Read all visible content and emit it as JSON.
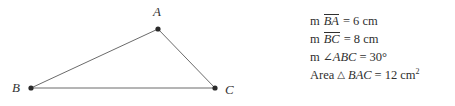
{
  "figure": {
    "type": "triangle-diagram",
    "vertices": [
      {
        "name": "A",
        "label": "A",
        "x": 158,
        "y": 29,
        "label_x": 153,
        "label_y": 5
      },
      {
        "name": "B",
        "label": "B",
        "x": 31,
        "y": 88,
        "label_x": 12,
        "label_y": 81
      },
      {
        "name": "C",
        "label": "C",
        "x": 215,
        "y": 88,
        "label_x": 225,
        "label_y": 83
      }
    ],
    "edges": [
      {
        "name": "BA",
        "from": "B",
        "to": "A"
      },
      {
        "name": "AC",
        "from": "A",
        "to": "C"
      },
      {
        "name": "BC",
        "from": "B",
        "to": "C"
      }
    ],
    "line_color": "#6b6b6b",
    "vertex_color": "#2a2a2a",
    "label_color": "#333333"
  },
  "measurements": {
    "lines": [
      {
        "prefix": "m",
        "segment": "BA",
        "has_overline": true,
        "relation": "=",
        "value": "6 cm",
        "text": "m BA = 6 cm"
      },
      {
        "prefix": "m",
        "segment": "BC",
        "has_overline": true,
        "relation": "=",
        "value": "8 cm",
        "text": "m BC = 8 cm"
      },
      {
        "prefix": "m",
        "angle_symbol": "∠",
        "segment": "ABC",
        "has_overline": false,
        "relation": "=",
        "value": "30°",
        "text": "m ∠ABC = 30°"
      },
      {
        "prefix": "Area",
        "triangle_symbol": "△",
        "segment": "BAC",
        "has_overline": false,
        "relation": "=",
        "value": "12 cm",
        "value_superscript": "2",
        "text": "Area △ BAC = 12 cm²"
      }
    ]
  }
}
